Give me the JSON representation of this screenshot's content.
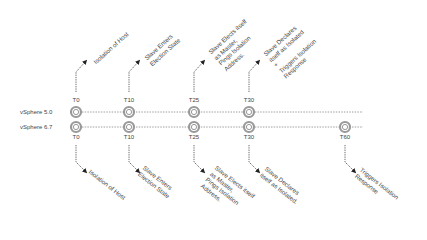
{
  "rows": [
    {
      "label": "vSphere 5.0",
      "y": 112
    },
    {
      "label": "vSphere 6.7",
      "y": 127
    }
  ],
  "top_ticks": [
    {
      "label": "T0",
      "x": 76
    },
    {
      "label": "T10",
      "x": 129
    },
    {
      "label": "T25",
      "x": 194
    },
    {
      "label": "T30",
      "x": 249
    }
  ],
  "bottom_ticks": [
    {
      "label": "T0",
      "x": 76
    },
    {
      "label": "T10",
      "x": 129
    },
    {
      "label": "T25",
      "x": 194
    },
    {
      "label": "T30",
      "x": 249
    },
    {
      "label": "T60",
      "x": 345
    }
  ],
  "top_notes": [
    "Isolation of Host",
    "Slave Enters\nElection State",
    "Slave Elects itself\nas Master,\nPings Isolation\nAddress.",
    "Slave Declares\nitself as Isolated\n+\nTriggers Isolation\nResponse"
  ],
  "bottom_notes": [
    "Isolation of Host",
    "Slave Enters\nElection State",
    "Slave Elects itself\nas Master,\nPings Isolation\nAddress.",
    "Slave Declares\nitself as Isolated.",
    "Triggers Isolation\nResponse"
  ],
  "colors": {
    "line": "#888888",
    "circle": "#999999",
    "arrow": "#222222"
  }
}
